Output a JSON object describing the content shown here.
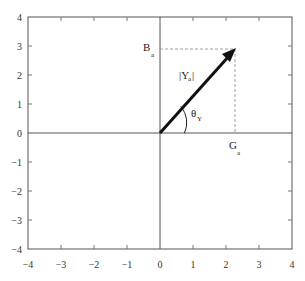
{
  "diagram": {
    "type": "admittance-phasor",
    "x_range": [
      -4,
      4
    ],
    "y_range": [
      -4,
      4
    ],
    "x_ticks": [
      "−4",
      "−3",
      "−2",
      "−1",
      "0",
      "1",
      "2",
      "3",
      "4"
    ],
    "y_ticks": [
      "4",
      "3",
      "2",
      "1",
      "0",
      "−1",
      "−2",
      "−3",
      "−4"
    ],
    "vector": {
      "x": 2.27,
      "y": 2.9
    },
    "labels": {
      "magnitude": "|Y",
      "magnitude_sub": "a",
      "magnitude_close": "|",
      "angle": "θ",
      "angle_sub": "Y",
      "real_component": "G",
      "real_component_sub": "a",
      "imag_component": "B",
      "imag_component_sub": "a"
    }
  },
  "colors": {
    "axis": "#555555",
    "vector": "#111111",
    "dashed": "#888888"
  }
}
